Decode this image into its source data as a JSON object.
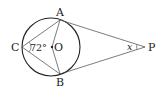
{
  "diagram": {
    "type": "geometry",
    "points": {
      "A": {
        "label": "A",
        "x": 60,
        "y": 20
      },
      "B": {
        "label": "B",
        "x": 60,
        "y": 74
      },
      "C": {
        "label": "C",
        "x": 22,
        "y": 47
      },
      "O": {
        "label": "O",
        "x": 52,
        "y": 47
      },
      "P": {
        "label": "P",
        "x": 145,
        "y": 47
      }
    },
    "circle": {
      "center": "O",
      "cx": 51,
      "cy": 47,
      "r": 29
    },
    "angle_labels": {
      "angle_C": "72°",
      "angle_P": "x"
    },
    "colors": {
      "stroke": "#333333",
      "circle": "#222222"
    }
  }
}
